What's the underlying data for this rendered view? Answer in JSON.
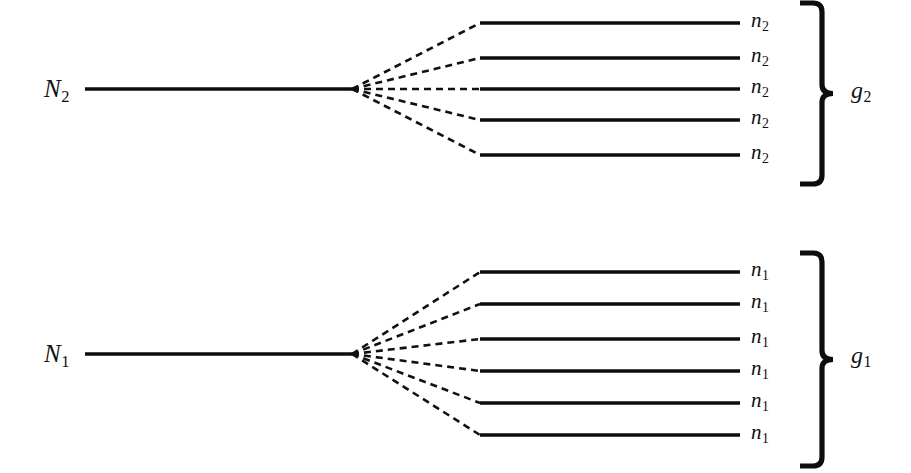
{
  "figure": {
    "type": "energy-level-degeneracy-diagram",
    "background_color": "#ffffff",
    "line_color": "#0d0d0d",
    "width": 911,
    "height": 473
  },
  "groups": [
    {
      "id": "upper",
      "trunk_label": {
        "base": "N",
        "sub": "2",
        "text": "N2"
      },
      "brace_label": {
        "base": "g",
        "sub": "2",
        "text": "g2"
      },
      "level_count": 5,
      "levels": [
        {
          "base": "n",
          "sub": "2",
          "text": "n2"
        },
        {
          "base": "n",
          "sub": "2",
          "text": "n2"
        },
        {
          "base": "n",
          "sub": "2",
          "text": "n2"
        },
        {
          "base": "n",
          "sub": "2",
          "text": "n2"
        },
        {
          "base": "n",
          "sub": "2",
          "text": "n2"
        }
      ]
    },
    {
      "id": "lower",
      "trunk_label": {
        "base": "N",
        "sub": "1",
        "text": "N1"
      },
      "brace_label": {
        "base": "g",
        "sub": "1",
        "text": "g1"
      },
      "level_count": 6,
      "levels": [
        {
          "base": "n",
          "sub": "1",
          "text": "n1"
        },
        {
          "base": "n",
          "sub": "1",
          "text": "n1"
        },
        {
          "base": "n",
          "sub": "1",
          "text": "n1"
        },
        {
          "base": "n",
          "sub": "1",
          "text": "n1"
        },
        {
          "base": "n",
          "sub": "1",
          "text": "n1"
        },
        {
          "base": "n",
          "sub": "1",
          "text": "n1"
        }
      ]
    }
  ],
  "geometry": {
    "upper": {
      "trunk": {
        "x1": 85,
        "x2": 352,
        "y": 89
      },
      "fan_origin": {
        "x": 352,
        "y": 89
      },
      "level_x1": 480,
      "level_x2": 740,
      "level_y": [
        23,
        58,
        89,
        120,
        155
      ],
      "label_x": 751,
      "brace": {
        "x_arm": 800,
        "x_stem": 822,
        "x_tip": 833,
        "y_top": 3,
        "y_bottom": 184
      },
      "brace_label_pos": {
        "x": 851,
        "y": 78
      },
      "trunk_label_pos": {
        "x": 44,
        "y": 76
      }
    },
    "lower": {
      "trunk": {
        "x1": 85,
        "x2": 352,
        "y": 354
      },
      "fan_origin": {
        "x": 352,
        "y": 354
      },
      "level_x1": 480,
      "level_x2": 740,
      "level_y": [
        272,
        304,
        339,
        371,
        403,
        435
      ],
      "label_x": 751,
      "brace": {
        "x_arm": 800,
        "x_stem": 822,
        "x_tip": 833,
        "y_top": 253,
        "y_bottom": 466
      },
      "brace_label_pos": {
        "x": 851,
        "y": 343
      },
      "trunk_label_pos": {
        "x": 44,
        "y": 341
      }
    }
  }
}
